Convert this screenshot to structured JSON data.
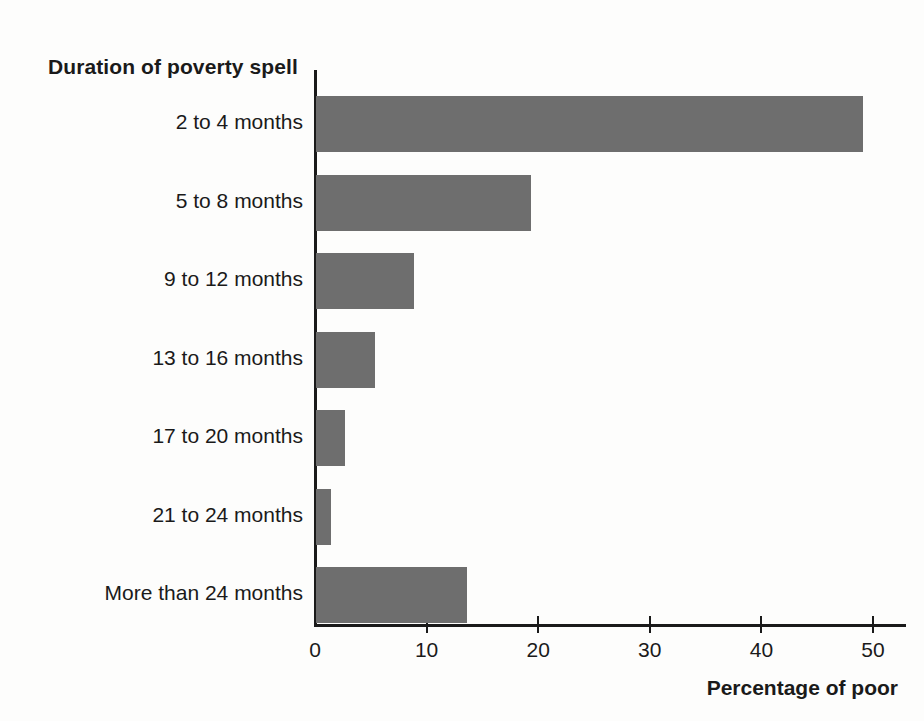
{
  "chart_data": {
    "type": "bar",
    "orientation": "horizontal",
    "title": "Duration of poverty spell",
    "xlabel": "Percentage of poor",
    "ylabel": "Duration of poverty spell",
    "categories": [
      "2 to 4 months",
      "5 to 8 months",
      "9 to 12 months",
      "13 to 16 months",
      "17 to 20 months",
      "21 to 24 months",
      "More than 24 months"
    ],
    "values": [
      49.0,
      19.3,
      8.8,
      5.3,
      2.6,
      1.3,
      13.5
    ],
    "xlim": [
      0,
      53
    ],
    "xticks": [
      0,
      10,
      20,
      30,
      40,
      50
    ],
    "xtick_labels": [
      "0",
      "10",
      "20",
      "30",
      "40",
      "50"
    ],
    "grid": false,
    "legend": null,
    "bar_color": "#6e6e6e",
    "axis_color": "#1a1a1a",
    "background": "#fdfdfc"
  }
}
